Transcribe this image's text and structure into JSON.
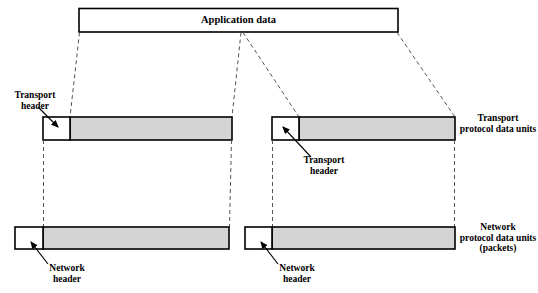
{
  "figure": {
    "colors": {
      "stroke": "#000000",
      "payload_fill": "#d4d4d4",
      "header_fill": "#ffffff",
      "dashed": "#555555",
      "background": "#ffffff"
    }
  },
  "application": {
    "box_label": "Application data"
  },
  "transport_layer": {
    "right_label": "Transport\nprotocol data units",
    "units": [
      {
        "header_label": "Transport\nheader",
        "payload_label": ""
      },
      {
        "header_label": "Transport\nheader",
        "payload_label": ""
      }
    ]
  },
  "network_layer": {
    "right_label": "Network\nprotocol data units\n(packets)",
    "units": [
      {
        "header_label": "Network\nheader",
        "payload_label": ""
      },
      {
        "header_label": "Network\nheader",
        "payload_label": ""
      }
    ]
  }
}
